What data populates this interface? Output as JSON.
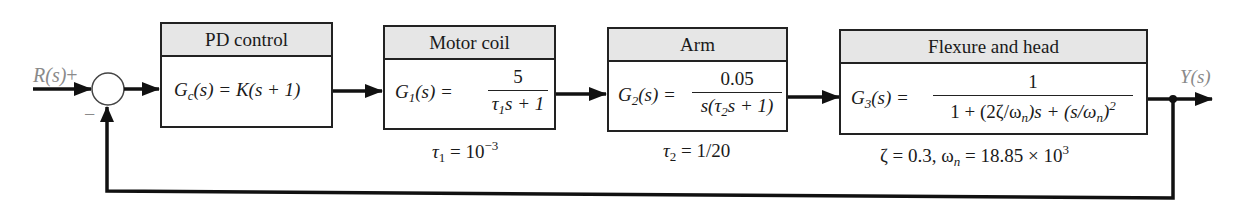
{
  "diagram": {
    "type": "feedback block diagram",
    "input": {
      "label": "R(s)",
      "sign": "+"
    },
    "feedback_sign": "−",
    "output": {
      "label": "Y(s)"
    },
    "blocks": [
      {
        "title": "PD control",
        "lhs": "G",
        "lhs_sub": "c",
        "lhs_arg": "(s) = ",
        "rhs": "K(s + 1)"
      },
      {
        "title": "Motor coil",
        "lhs": "G",
        "lhs_sub": "1",
        "lhs_arg": "(s) = ",
        "numerator": "5",
        "denominator_a": "τ",
        "denominator_sub": "1",
        "denominator_b": "s + 1",
        "param_a": "τ",
        "param_sub": "1",
        "param_b": " = 10",
        "param_sup": "−3"
      },
      {
        "title": "Arm",
        "lhs": "G",
        "lhs_sub": "2",
        "lhs_arg": "(s) = ",
        "numerator": "0.05",
        "denominator_a": "s(τ",
        "denominator_sub": "2",
        "denominator_b": "s + 1)",
        "param_a": "τ",
        "param_sub": "2",
        "param_b": " = 1/20"
      },
      {
        "title": "Flexure and head",
        "lhs": "G",
        "lhs_sub": "3",
        "lhs_arg": "(s) = ",
        "numerator": "1",
        "denominator_a": "1 + (2ζ/ω",
        "denominator_sub": "n",
        "denominator_b": ")s + (s/ω",
        "denominator_sub2": "n",
        "denominator_c": ")",
        "denominator_sup": "2",
        "param_a": "ζ = 0.3, ω",
        "param_sub": "n",
        "param_b": " = 18.85 × 10",
        "param_sup": "3"
      }
    ]
  },
  "colors": {
    "line": "#111111",
    "header_bg": "#e6e6e6",
    "signal_label": "#8a8a8a"
  }
}
